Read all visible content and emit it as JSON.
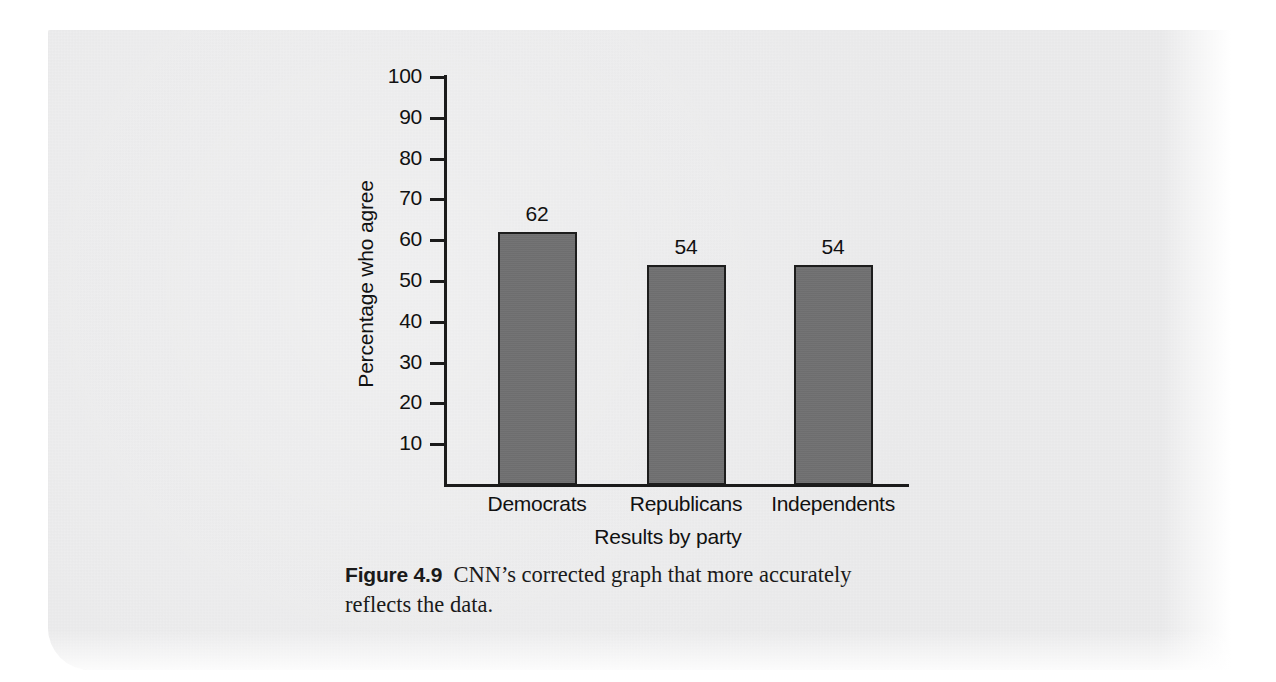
{
  "figure": {
    "label": "Figure 4.9",
    "caption_text": "CNN’s corrected graph that more accurately reflects the data."
  },
  "colors": {
    "bar_fill": "#6f6f70",
    "bar_edge": "#1d1d1d",
    "axis": "#1b1b1b",
    "text": "#111111",
    "page_background": "#ececed",
    "outer_background": "#ffffff"
  },
  "chart_data": {
    "type": "bar",
    "title": "",
    "categories": [
      "Democrats",
      "Republicans",
      "Independents"
    ],
    "values": [
      62,
      54,
      54
    ],
    "data_labels": [
      "62",
      "54",
      "54"
    ],
    "xlabel": "Results by party",
    "ylabel": "Percentage who agree",
    "ylim": [
      0,
      100
    ],
    "ytick_values": [
      10,
      20,
      30,
      40,
      50,
      60,
      70,
      80,
      90,
      100
    ],
    "ytick_labels": [
      "10",
      "20",
      "30",
      "40",
      "50",
      "60",
      "70",
      "80",
      "90",
      "100"
    ],
    "grid": false,
    "legend": false,
    "legend_position": "none",
    "bar_count": 3
  }
}
